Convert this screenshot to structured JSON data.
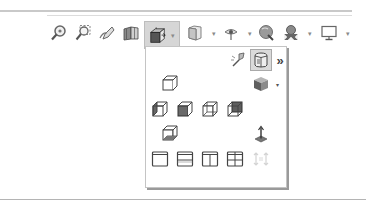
{
  "toolbar": {
    "items": [
      {
        "name": "zoom-to-fit",
        "icon": "magnifier-icon"
      },
      {
        "name": "zoom-to-area",
        "icon": "zoom-area-icon"
      },
      {
        "name": "previous-view",
        "icon": "previous-view-icon"
      },
      {
        "name": "section-view",
        "icon": "section-view-icon"
      },
      {
        "name": "view-orientation",
        "icon": "view-orientation-icon",
        "active": true,
        "has_dropdown": true
      },
      {
        "name": "display-style",
        "icon": "display-style-icon",
        "has_dropdown": true
      },
      {
        "name": "hide-show-items",
        "icon": "eye-icon",
        "has_dropdown": true
      },
      {
        "name": "edit-appearance",
        "icon": "appearance-icon"
      },
      {
        "name": "apply-scene",
        "icon": "scene-icon",
        "has_dropdown": true
      },
      {
        "name": "view-settings",
        "icon": "monitor-icon",
        "has_dropdown": true
      }
    ],
    "caret": "▾"
  },
  "panel": {
    "header": {
      "pin_icon": "pin-view-icon",
      "selected_icon": "normal-to-icon",
      "more_label": "»"
    },
    "views": {
      "top": "top-view-icon",
      "isometric": "isometric-view-icon",
      "row2": [
        "left-view-icon",
        "front-view-icon",
        "right-view-icon",
        "back-view-icon"
      ],
      "bottom": "bottom-view-icon",
      "normal_to": "normal-to-view-icon"
    },
    "viewports": [
      "single-view-icon",
      "two-view-horizontal-icon",
      "two-view-vertical-icon",
      "four-view-icon",
      "link-views-icon"
    ],
    "caret": "▾"
  }
}
